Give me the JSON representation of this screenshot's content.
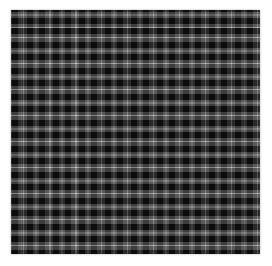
{
  "canvas": {
    "width": 272,
    "height": 266,
    "background": "#ffffff"
  },
  "swatch": {
    "left": 11,
    "top": 10,
    "width": 249,
    "height": 244,
    "pattern": {
      "type": "tartan-plaid",
      "repeat_px": 26,
      "colors": {
        "black": "#0c0c0c",
        "gray": "#5a5a5a",
        "bright_line": "#c8c8c8",
        "dim_line": "#8e8e8e"
      },
      "stripes": [
        {
          "color": "bright_line",
          "from": 0,
          "to": 1.5
        },
        {
          "color": "gray",
          "from": 1.5,
          "to": 4
        },
        {
          "color": "black",
          "from": 4,
          "to": 10.5
        },
        {
          "color": "gray",
          "from": 10.5,
          "to": 12.5
        },
        {
          "color": "dim_line",
          "from": 12.5,
          "to": 14
        },
        {
          "color": "gray",
          "from": 14,
          "to": 16
        },
        {
          "color": "black",
          "from": 16,
          "to": 22.5
        },
        {
          "color": "gray",
          "from": 22.5,
          "to": 26
        }
      ],
      "cross_layer_alpha": 0.62,
      "phase": {
        "x": 12,
        "y": 18
      }
    }
  }
}
